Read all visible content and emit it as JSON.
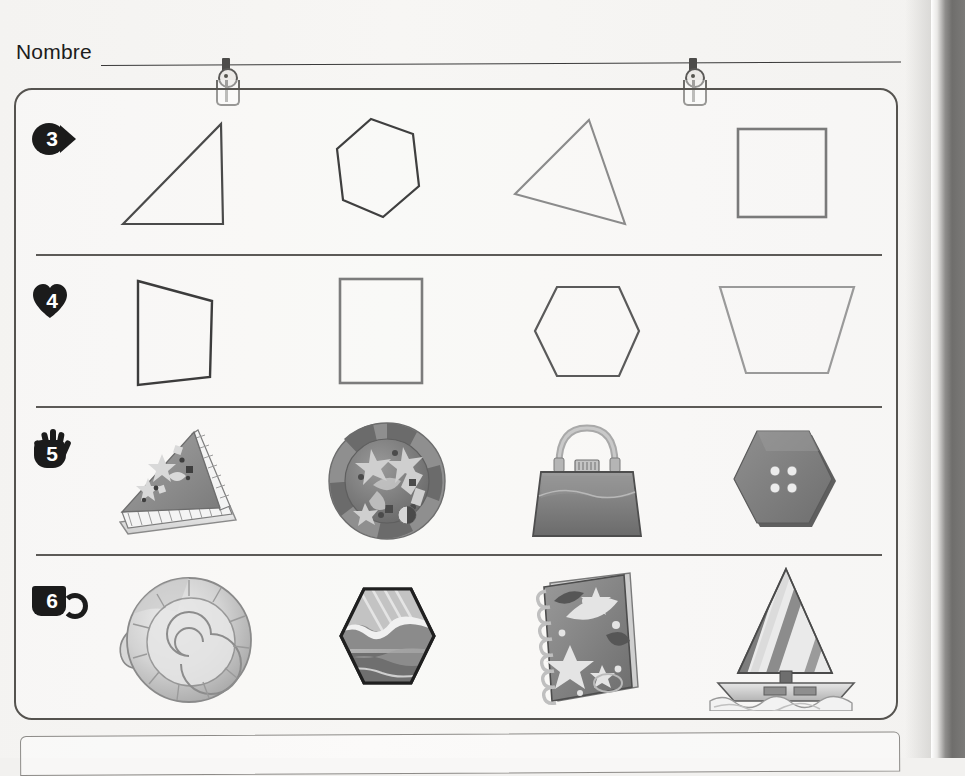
{
  "page": {
    "language": "es",
    "name_label": "Nombre",
    "name_value": "",
    "paper_color": "#f4f3f1",
    "ink_color": "#3a3a3a"
  },
  "attachments": [
    {
      "name": "binder-clip",
      "x": 213,
      "y": 58
    },
    {
      "name": "binder-clip",
      "x": 680,
      "y": 58
    }
  ],
  "worksheet": {
    "rows": [
      {
        "number": "3",
        "marker_icon": "fish-icon",
        "kind": "outline-shapes",
        "items": [
          {
            "label": "right triangle",
            "shape": "triangle-right",
            "stroke": "#4a4a4a"
          },
          {
            "label": "hexagon",
            "shape": "hexagon-tall",
            "stroke": "#3f3f3f"
          },
          {
            "label": "scalene triangle",
            "shape": "triangle-scalene",
            "stroke": "#8b8b8b"
          },
          {
            "label": "square",
            "shape": "square",
            "stroke": "#7a7a7a"
          }
        ]
      },
      {
        "number": "4",
        "marker_icon": "heart-icon",
        "kind": "outline-shapes",
        "items": [
          {
            "label": "quadrilateral",
            "shape": "quad-irregular",
            "stroke": "#3c3c3c"
          },
          {
            "label": "rectangle",
            "shape": "rectangle",
            "stroke": "#7c7c7c"
          },
          {
            "label": "hexagon",
            "shape": "hexagon-wide",
            "stroke": "#5a5a5a"
          },
          {
            "label": "trapezoid",
            "shape": "trapezoid",
            "stroke": "#9a9a9a"
          }
        ]
      },
      {
        "number": "5",
        "marker_icon": "hand-icon",
        "kind": "pictures",
        "items": [
          {
            "label": "slice of cake",
            "picture": "cake-slice-picture"
          },
          {
            "label": "party plate",
            "picture": "round-plate-picture"
          },
          {
            "label": "handbag",
            "picture": "handbag-picture"
          },
          {
            "label": "hexagon button",
            "picture": "hexagon-button-picture"
          }
        ]
      },
      {
        "number": "6",
        "marker_icon": "cup-icon",
        "kind": "pictures",
        "items": [
          {
            "label": "snail shell",
            "picture": "spiral-shell-picture"
          },
          {
            "label": "hexagon landscape tile",
            "picture": "hexagon-scene-picture"
          },
          {
            "label": "spiral notebook",
            "picture": "notebook-picture"
          },
          {
            "label": "sailboat",
            "picture": "sailboat-picture"
          }
        ]
      }
    ]
  }
}
